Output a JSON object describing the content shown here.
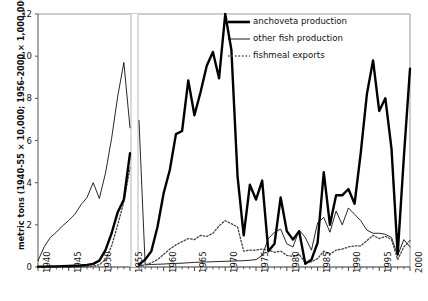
{
  "axis": {
    "ylabel": "metric tons (1940-55 × 10,000; 1956-2000 × 1,000,000)",
    "yticks": [
      "0",
      "2",
      "4",
      "6",
      "8",
      "10",
      "12"
    ],
    "xticks": [
      "1940",
      "1945",
      "1950",
      "1955",
      "1960",
      "1965",
      "1970",
      "1975",
      "1980",
      "1985",
      "1990",
      "1995",
      "2000"
    ]
  },
  "legend": {
    "items": [
      {
        "label": "anchoveta production",
        "style": "thick-solid",
        "color": "#000000"
      },
      {
        "label": "other fish production",
        "style": "thin-solid",
        "color": "#000000"
      },
      {
        "label": "fishmeal exports",
        "style": "dotted",
        "color": "#555555"
      }
    ]
  },
  "chart_data": {
    "type": "line",
    "title": "",
    "xlabel": "",
    "ylabel": "metric tons (1940-55 × 10,000; 1956-2000 × 1,000,000)",
    "xlim": [
      1940,
      2000
    ],
    "ylim": [
      0,
      12
    ],
    "grid": false,
    "legend_position": "top-right",
    "scale_break_at": 1955.5,
    "scale_note": "values 1940-1955 are in units of 10,000 metric tons; values 1956-2000 are in units of 1,000,000 metric tons",
    "x": [
      1940,
      1941,
      1942,
      1943,
      1944,
      1945,
      1946,
      1947,
      1948,
      1949,
      1950,
      1951,
      1952,
      1953,
      1954,
      1955,
      1956,
      1957,
      1958,
      1959,
      1960,
      1961,
      1962,
      1963,
      1964,
      1965,
      1966,
      1967,
      1968,
      1969,
      1970,
      1971,
      1972,
      1973,
      1974,
      1975,
      1976,
      1977,
      1978,
      1979,
      1980,
      1981,
      1982,
      1983,
      1984,
      1985,
      1986,
      1987,
      1988,
      1989,
      1990,
      1991,
      1992,
      1993,
      1994,
      1995,
      1996,
      1997,
      1998,
      1999,
      2000
    ],
    "series": [
      {
        "name": "anchoveta production",
        "style": "thick-solid",
        "values": [
          0.02,
          0.02,
          0.03,
          0.03,
          0.04,
          0.05,
          0.06,
          0.07,
          0.1,
          0.15,
          0.3,
          0.8,
          1.6,
          2.6,
          3.2,
          5.4,
          0.12,
          0.35,
          0.75,
          1.9,
          3.5,
          4.6,
          6.3,
          6.45,
          8.85,
          7.2,
          8.3,
          9.55,
          10.2,
          8.95,
          12.0,
          10.3,
          4.3,
          1.5,
          3.9,
          3.2,
          4.1,
          0.75,
          1.1,
          3.3,
          1.7,
          1.3,
          1.7,
          0.15,
          0.35,
          1.15,
          4.5,
          2.0,
          3.4,
          3.4,
          3.7,
          3.0,
          5.4,
          8.2,
          9.8,
          7.4,
          8.0,
          5.6,
          0.6,
          5.2,
          9.4
        ]
      },
      {
        "name": "other fish production",
        "style": "thin-solid",
        "values": [
          0.3,
          0.95,
          1.4,
          1.65,
          1.95,
          2.2,
          2.5,
          2.95,
          3.3,
          4.0,
          3.25,
          4.45,
          6.1,
          8.1,
          9.7,
          6.6,
          6.95,
          0.1,
          0.12,
          0.13,
          0.14,
          0.16,
          0.17,
          0.18,
          0.2,
          0.22,
          0.23,
          0.24,
          0.25,
          0.26,
          0.27,
          0.28,
          0.29,
          0.3,
          0.32,
          0.35,
          0.55,
          1.35,
          1.65,
          1.8,
          1.1,
          0.95,
          1.75,
          1.4,
          0.8,
          2.1,
          2.35,
          1.65,
          2.65,
          2.0,
          2.8,
          2.5,
          2.2,
          1.75,
          1.6,
          1.6,
          1.55,
          1.4,
          0.55,
          1.3,
          0.95
        ]
      },
      {
        "name": "fishmeal exports",
        "style": "dotted",
        "values": [
          0.0,
          0.0,
          0.0,
          0.0,
          0.0,
          0.0,
          0.0,
          0.0,
          0.02,
          0.05,
          0.1,
          0.35,
          1.0,
          2.0,
          3.1,
          4.7,
          0.05,
          0.1,
          0.2,
          0.35,
          0.6,
          0.85,
          1.05,
          1.2,
          1.35,
          1.3,
          1.5,
          1.45,
          1.6,
          1.95,
          2.2,
          2.05,
          1.9,
          0.75,
          0.8,
          0.8,
          0.85,
          0.8,
          0.7,
          0.75,
          0.55,
          0.5,
          0.6,
          0.2,
          0.25,
          0.4,
          0.75,
          0.6,
          0.8,
          0.85,
          0.95,
          1.0,
          1.0,
          1.25,
          1.5,
          1.35,
          1.45,
          1.3,
          0.35,
          0.95,
          1.25
        ]
      }
    ]
  }
}
